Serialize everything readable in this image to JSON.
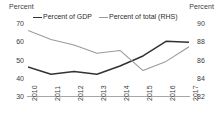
{
  "chart_data": {
    "type": "line",
    "title": "",
    "subtitle": "",
    "xlabel": "",
    "ylabel": "Percent",
    "y2label": "Percent",
    "grid": false,
    "legend_position": "top",
    "categories": [
      "2010",
      "2011",
      "2012",
      "2013",
      "2014",
      "2015",
      "2016",
      "2017"
    ],
    "yticks": [
      "70",
      "60",
      "50",
      "40",
      "30"
    ],
    "y2ticks": [
      "90",
      "88",
      "86",
      "84",
      "82"
    ],
    "ylim": [
      30,
      70
    ],
    "y2lim": [
      82,
      90
    ],
    "series": [
      {
        "name": "Percent of GDP",
        "axis": "left",
        "color": "#333333",
        "values": [
          46.5,
          42.5,
          44.0,
          42.5,
          47.0,
          52.5,
          60.5,
          60.0
        ]
      },
      {
        "name": "Percent of total (RHS)",
        "axis": "right",
        "color": "#9a9a9a",
        "values": [
          89.3,
          88.3,
          87.7,
          86.8,
          87.1,
          84.9,
          85.9,
          87.5
        ]
      }
    ]
  },
  "labels": {
    "left_unit": "Percent",
    "right_unit": "Percent"
  },
  "legend": {
    "items": [
      {
        "label": "Percent of GDP",
        "color": "#333333"
      },
      {
        "label": "Percent of total (RHS)",
        "color": "#9a9a9a"
      }
    ]
  }
}
